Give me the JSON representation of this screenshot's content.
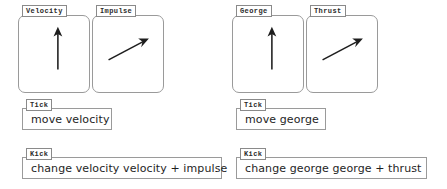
{
  "meta": {
    "background_color": "#ffffff",
    "line_color": "#9a9a9a",
    "ink_color": "#1e1e1e"
  },
  "scripts": [
    {
      "id": "velocity-script",
      "panels": [
        {
          "name": "velocity",
          "tab_label": "Velocity",
          "arrow": "up",
          "arrow_description": "vertical arrow pointing up"
        },
        {
          "name": "impulse",
          "tab_label": "Impulse",
          "arrow": "up-right",
          "arrow_description": "diagonal arrow pointing up and to the right"
        }
      ],
      "blocks": [
        {
          "name": "tick-move-velocity",
          "tab_label": "Tick",
          "text": "move velocity"
        },
        {
          "name": "kick-change-velocity",
          "tab_label": "Kick",
          "text": "change velocity velocity + impulse"
        }
      ]
    },
    {
      "id": "george-script",
      "panels": [
        {
          "name": "george",
          "tab_label": "George",
          "arrow": "up",
          "arrow_description": "vertical arrow pointing up"
        },
        {
          "name": "thrust",
          "tab_label": "Thrust",
          "arrow": "up-right",
          "arrow_description": "diagonal arrow pointing up and to the right"
        }
      ],
      "blocks": [
        {
          "name": "tick-move-george",
          "tab_label": "Tick",
          "text": "move george"
        },
        {
          "name": "kick-change-george",
          "tab_label": "Kick",
          "text": "change george george + thrust"
        }
      ]
    }
  ]
}
